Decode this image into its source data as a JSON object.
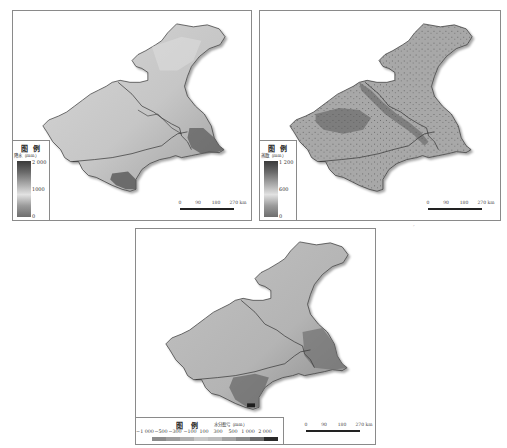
{
  "figure": {
    "panels": [
      {
        "id": "precipitation",
        "legend": {
          "title": "图 例",
          "subtitle": "降水（mm）",
          "ticks": [
            "2 000",
            "1000",
            "0"
          ],
          "ramp_colors": [
            "#3a3a3a",
            "#6a6a6a",
            "#a6a6a6",
            "#e2e2e2",
            "#9a9a9a",
            "#6e6e6e"
          ]
        },
        "map_fill": {
          "base": "#c9c9c9",
          "light": "#dcdcdc",
          "dark": "#5a5a5a"
        },
        "scale_bar": {
          "labels": [
            "0",
            "90",
            "180",
            "270 km"
          ]
        }
      },
      {
        "id": "evapotranspiration",
        "legend": {
          "title": "图 例",
          "subtitle": "蒸散（mm）",
          "ticks": [
            "1 200",
            "600",
            "0"
          ],
          "ramp_colors": [
            "#3a3a3a",
            "#6a6a6a",
            "#a6a6a6",
            "#e2e2e2",
            "#9a9a9a",
            "#6e6e6e"
          ]
        },
        "map_fill": {
          "base": "#a9a9a9",
          "light": "#c4c4c4",
          "dark": "#555555"
        },
        "scale_bar": {
          "labels": [
            "0",
            "90",
            "180",
            "270 km"
          ]
        }
      },
      {
        "id": "water-surplus-deficit",
        "legend": {
          "title": "图 例",
          "subtitle": "水分盈亏（mm）",
          "labels": [
            "−1 000",
            "−500",
            "−300",
            "−100",
            "100",
            "300",
            "500",
            "1 000",
            "2 000"
          ],
          "swatch_colors": [
            "#8c8c8c",
            "#9e9e9e",
            "#b0b0b0",
            "#c8c8c8",
            "#bdbdbd",
            "#a3a3a3",
            "#8a8a8a",
            "#6a6a6a",
            "#2a2a2a"
          ]
        },
        "map_fill": {
          "base": "#b9b9b9",
          "light": "#c8c8c8",
          "dark": "#6a6a6a"
        },
        "scale_bar": {
          "labels": [
            "0",
            "90",
            "180",
            "270 km"
          ]
        }
      }
    ],
    "stray_mark": "ˊ"
  }
}
